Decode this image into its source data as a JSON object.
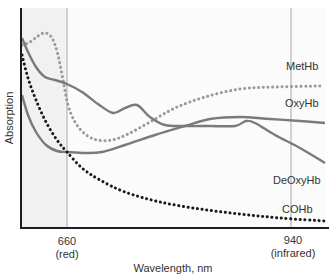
{
  "chart_data": {
    "type": "line",
    "title": "",
    "xlabel": "Wavelength, nm",
    "ylabel": "Absorption",
    "x_ticks": [
      {
        "value": "660",
        "sub": "(red)"
      },
      {
        "value": "940",
        "sub": "(infrared)"
      }
    ],
    "grid": false,
    "legend_position": "inline-right",
    "shaded_region": "left of 660 nm",
    "series": [
      {
        "name": "MetHb",
        "style": "dotted",
        "color": "#9a9a9a",
        "points_px": [
          [
            22,
            45
          ],
          [
            30,
            42
          ],
          [
            38,
            36
          ],
          [
            45,
            33
          ],
          [
            52,
            38
          ],
          [
            58,
            55
          ],
          [
            63,
            80
          ],
          [
            68,
            105
          ],
          [
            75,
            122
          ],
          [
            85,
            134
          ],
          [
            97,
            140
          ],
          [
            112,
            140
          ],
          [
            128,
            134
          ],
          [
            150,
            122
          ],
          [
            175,
            108
          ],
          [
            205,
            97
          ],
          [
            240,
            89
          ],
          [
            275,
            87
          ],
          [
            320,
            86
          ]
        ]
      },
      {
        "name": "OxyHb",
        "style": "solid",
        "color": "#7a7a7a",
        "points_px": [
          [
            22,
            95
          ],
          [
            28,
            115
          ],
          [
            36,
            132
          ],
          [
            46,
            145
          ],
          [
            57,
            151
          ],
          [
            67,
            152
          ],
          [
            85,
            153
          ],
          [
            102,
            152
          ],
          [
            125,
            145
          ],
          [
            155,
            135
          ],
          [
            185,
            126
          ],
          [
            210,
            119
          ],
          [
            240,
            117
          ],
          [
            270,
            119
          ],
          [
            300,
            121
          ],
          [
            325,
            123
          ]
        ]
      },
      {
        "name": "DeOxyHb",
        "style": "solid",
        "color": "#7a7a7a",
        "points_px": [
          [
            22,
            38
          ],
          [
            28,
            52
          ],
          [
            36,
            67
          ],
          [
            45,
            77
          ],
          [
            55,
            80
          ],
          [
            67,
            84
          ],
          [
            82,
            92
          ],
          [
            98,
            104
          ],
          [
            113,
            113
          ],
          [
            125,
            108
          ],
          [
            137,
            105
          ],
          [
            150,
            117
          ],
          [
            165,
            125
          ],
          [
            185,
            126
          ],
          [
            210,
            126
          ],
          [
            235,
            126
          ],
          [
            246,
            121
          ],
          [
            255,
            123
          ],
          [
            275,
            135
          ],
          [
            300,
            148
          ],
          [
            325,
            163
          ]
        ]
      },
      {
        "name": "COHb",
        "style": "dotted",
        "color": "#1a1a1a",
        "points_px": [
          [
            22,
            55
          ],
          [
            28,
            78
          ],
          [
            36,
            100
          ],
          [
            46,
            122
          ],
          [
            57,
            140
          ],
          [
            67,
            152
          ],
          [
            82,
            168
          ],
          [
            100,
            180
          ],
          [
            125,
            192
          ],
          [
            160,
            202
          ],
          [
            200,
            209
          ],
          [
            240,
            214
          ],
          [
            280,
            218
          ],
          [
            325,
            221
          ]
        ]
      }
    ],
    "labels": [
      {
        "text": "MetHb",
        "x": 287,
        "y": 70
      },
      {
        "text": "OxyHb",
        "x": 287,
        "y": 108
      },
      {
        "text": "DeOxyHb",
        "x": 276,
        "y": 184
      },
      {
        "text": "COHb",
        "x": 283,
        "y": 211
      }
    ]
  },
  "axes": {
    "y_label": "Absorption",
    "x_label": "Wavelength, nm",
    "tick_660": "660",
    "tick_660_sub": "(red)",
    "tick_940": "940",
    "tick_940_sub": "(infrared)"
  },
  "legend": {
    "methb": "MetHb",
    "oxyhb": "OxyHb",
    "deoxyhb": "DeOxyHb",
    "cohb": "COHb"
  },
  "colors": {
    "axis": "#1e1e1e",
    "guide_line": "#a8a8a8",
    "shade": "#f1f1f1",
    "solid_curve": "#7a7a7a",
    "grey_dots": "#9a9a9a",
    "black_dots": "#1a1a1a"
  }
}
